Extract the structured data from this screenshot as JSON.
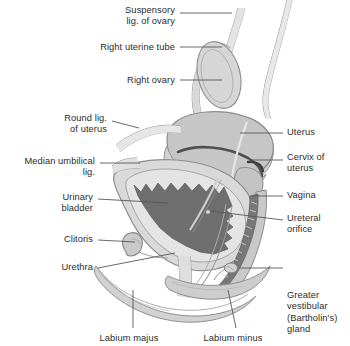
{
  "figure": {
    "palette": {
      "background": "#ffffff",
      "text": "#2b2b2b",
      "leader_line": "#5a5a5a",
      "outline": "#8e8e8e",
      "uterus_fill": "#c6c6c6",
      "uterus_light": "#d2d2d2",
      "bladder_wall": "#d9d9d9",
      "bladder_lumen": "#6e6e6e",
      "vagina_lumen": "#777777",
      "cervix_dark": "#4a4a4a",
      "ovary_fill": "#d6d6d6",
      "tube_fill": "#d0d0d0",
      "labia_fill": "#d8d8d8",
      "labia_shade": "#cacaca",
      "perineum_fill": "#e2e2e2"
    }
  },
  "labels": {
    "left": [
      {
        "key": "suspensory-ligament-of-ovary",
        "text": "Suspensory\nlig. of ovary",
        "x": 103,
        "y": 5,
        "w": 72,
        "leader": [
          [
            180,
            13
          ],
          [
            232,
            13
          ]
        ]
      },
      {
        "key": "right-uterine-tube",
        "text": "Right uterine tube",
        "x": 78,
        "y": 42,
        "w": 97,
        "leader": [
          [
            180,
            47
          ],
          [
            222,
            47
          ]
        ]
      },
      {
        "key": "right-ovary",
        "text": "Right ovary",
        "x": 110,
        "y": 75,
        "w": 65,
        "leader": [
          [
            180,
            80
          ],
          [
            222,
            80
          ]
        ]
      },
      {
        "key": "round-ligament-of-uterus",
        "text": "Round lig.\nof uterus",
        "x": 42,
        "y": 113,
        "w": 65,
        "leader": [
          [
            112,
            121
          ],
          [
            139,
            128
          ]
        ]
      },
      {
        "key": "median-umbilical-ligament",
        "text": "Median umbilical\nlig.",
        "x": 3,
        "y": 156,
        "w": 92,
        "leader": [
          [
            100,
            163
          ],
          [
            140,
            163
          ]
        ]
      },
      {
        "key": "urinary-bladder",
        "text": "Urinary\nbladder",
        "x": 28,
        "y": 192,
        "w": 65,
        "leader": [
          [
            98,
            199
          ],
          [
            168,
            203
          ]
        ]
      },
      {
        "key": "clitoris",
        "text": "Clitoris",
        "x": 33,
        "y": 234,
        "w": 60,
        "leader": [
          [
            98,
            240
          ],
          [
            135,
            242
          ]
        ]
      },
      {
        "key": "urethra",
        "text": "Urethra",
        "x": 31,
        "y": 262,
        "w": 62,
        "leader": [
          [
            98,
            268
          ],
          [
            175,
            253
          ]
        ]
      }
    ],
    "right": [
      {
        "key": "uterus",
        "text": "Uterus",
        "x": 287,
        "y": 127,
        "w": 62,
        "leader": [
          [
            240,
            133
          ],
          [
            283,
            133
          ]
        ]
      },
      {
        "key": "cervix-of-uterus",
        "text": "Cervix of\nuterus",
        "x": 287,
        "y": 152,
        "w": 62,
        "leader": [
          [
            250,
            160
          ],
          [
            283,
            160
          ]
        ]
      },
      {
        "key": "vagina",
        "text": "Vagina",
        "x": 287,
        "y": 190,
        "w": 62,
        "leader": [
          [
            252,
            196
          ],
          [
            283,
            196
          ]
        ]
      },
      {
        "key": "ureteral-orifice",
        "text": "Ureteral\norifice",
        "x": 287,
        "y": 213,
        "w": 62,
        "leader": [
          [
            210,
            211
          ],
          [
            283,
            220
          ]
        ]
      },
      {
        "key": "greater-vestibular-bartholins-gland",
        "text": "Greater\nvestibular\n(Bartholin's)\ngland",
        "x": 287,
        "y": 290,
        "w": 62,
        "leader": [
          [
            240,
            268
          ],
          [
            283,
            268
          ]
        ]
      }
    ],
    "bottom": [
      {
        "key": "labium-majus",
        "text": "Labium majus",
        "x": 90,
        "y": 333,
        "w": 78,
        "leader": [
          [
            133,
            290
          ],
          [
            133,
            328
          ]
        ]
      },
      {
        "key": "labium-minus",
        "text": "Labium minus",
        "x": 194,
        "y": 333,
        "w": 78,
        "leader": [
          [
            228,
            290
          ],
          [
            236,
            328
          ]
        ]
      }
    ]
  }
}
